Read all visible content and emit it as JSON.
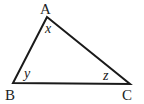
{
  "diagram": {
    "type": "triangle",
    "stroke_color": "#1a1a1a",
    "vertices": [
      {
        "label": "A",
        "x": 47,
        "y": 17
      },
      {
        "label": "B",
        "x": 13,
        "y": 83
      },
      {
        "label": "C",
        "x": 130,
        "y": 84
      }
    ],
    "angle_labels": [
      {
        "vertex": "A",
        "label": "x"
      },
      {
        "vertex": "B",
        "label": "y"
      },
      {
        "vertex": "C",
        "label": "z"
      }
    ]
  }
}
